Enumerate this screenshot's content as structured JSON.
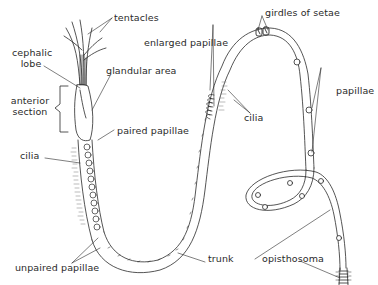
{
  "diagram": {
    "colors": {
      "line": "#2a2a2a",
      "background": "#ffffff",
      "cilia": "#777777"
    },
    "labels": {
      "tentacles": "tentacles",
      "cephalic_lobe_line1": "cephalic",
      "cephalic_lobe_line2": "lobe",
      "glandular_area": "glandular area",
      "anterior_section_line1": "anterior",
      "anterior_section_line2": "section",
      "paired_papillae": "paired papillae",
      "cilia_left": "cilia",
      "unpaired_papillae": "unpaired papillae",
      "enlarged_papillae": "enlarged papillae",
      "cilia_right": "cilia",
      "girdles_of_setae": "girdles of setae",
      "papillae": "papillae",
      "trunk": "trunk",
      "opisthosoma": "opisthosoma"
    }
  }
}
